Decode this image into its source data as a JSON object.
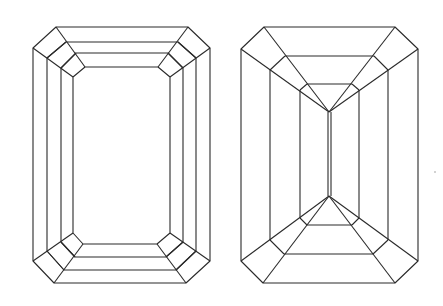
{
  "figure": {
    "type": "line-drawing",
    "stroke_color": "#2a2a2a",
    "background": "#ffffff",
    "panels": [
      {
        "name": "crown-view",
        "description": "step-cut crown with three concentric octagonal rings around a rectangular table",
        "rings": [
          {
            "top_y": 27,
            "top_x": [
              56,
              188
            ],
            "bottom_y": 283,
            "bottom_x": [
              54,
              186
            ],
            "side_x": [
              33,
              210
            ],
            "corner_y": [
              48,
              261
            ]
          },
          {
            "top_y": 42,
            "top_x": [
              66,
              178
            ],
            "bottom_y": 270,
            "bottom_x": [
              64,
              176
            ],
            "side_x": [
              47,
              196
            ],
            "corner_y": [
              58,
              251
            ]
          },
          {
            "top_y": 53,
            "top_x": [
              76,
              168
            ],
            "bottom_y": 257,
            "bottom_x": [
              75,
              166
            ],
            "side_x": [
              61,
              183
            ],
            "corner_y": [
              68,
              242
            ]
          },
          {
            "top_y": 67,
            "top_x": [
              85,
              158
            ],
            "bottom_y": 244,
            "bottom_x": [
              83,
              157
            ],
            "side_x": [
              73,
              170
            ],
            "corner_y": [
              77,
              233
            ]
          }
        ]
      },
      {
        "name": "pavilion-view",
        "description": "step-cut pavilion converging to a keel line",
        "outer": {
          "top_y": 27,
          "top_x": [
            264,
            395
          ],
          "bottom_y": 283,
          "bottom_x": [
            263,
            395
          ],
          "side_x": [
            241,
            418
          ],
          "corner_y": [
            49,
            261
          ]
        },
        "ring2": {
          "top_y": 56,
          "top_x": [
            285,
            374
          ],
          "bottom_y": 254,
          "bottom_x": [
            284,
            373
          ],
          "side_x": [
            270,
            388
          ],
          "vert_y": [
            70,
            240
          ]
        },
        "ring3": {
          "top_y": 84,
          "top_x": [
            307,
            352
          ],
          "bottom_y": 225,
          "bottom_x": [
            307,
            352
          ],
          "side_x": [
            300,
            359
          ],
          "vert_y": [
            90,
            218
          ]
        },
        "keel": {
          "x": [
            328,
            331
          ],
          "top_y": 112,
          "bottom_y": 196
        }
      }
    ]
  }
}
